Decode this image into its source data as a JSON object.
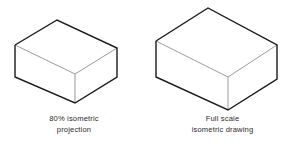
{
  "figure": {
    "background_color": "#ffffff",
    "outline_color": "#1a1a1a",
    "interior_line_color": "#9b9b9b",
    "text_color": "#2b2b2b"
  },
  "panels": [
    {
      "id": "left",
      "shape_name": "isometric-box-80-percent",
      "caption": {
        "line1": "80% isometric",
        "line2": "projection"
      },
      "geometry": {
        "top_apex": [
          57,
          20
        ],
        "left_vertex": [
          15,
          45
        ],
        "right_vertex": [
          117,
          48
        ],
        "front_vertex": [
          75,
          74
        ],
        "bottom_left": [
          15,
          77
        ],
        "bottom_front": [
          75,
          103
        ],
        "bottom_right": [
          117,
          77
        ]
      }
    },
    {
      "id": "right",
      "shape_name": "isometric-box-full-scale",
      "caption": {
        "line1": "Full scale",
        "line2": "isometric drawing"
      },
      "geometry": {
        "top_apex": [
          208,
          8
        ],
        "left_vertex": [
          156,
          41
        ],
        "right_vertex": [
          277,
          45
        ],
        "front_vertex": [
          228,
          77
        ],
        "bottom_left": [
          156,
          77
        ],
        "bottom_front": [
          228,
          110
        ],
        "bottom_right": [
          277,
          79
        ]
      }
    }
  ]
}
